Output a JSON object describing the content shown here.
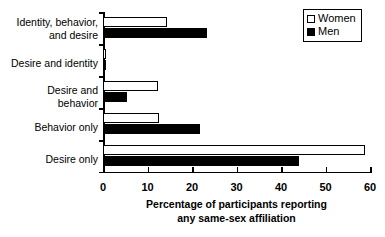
{
  "chart_data": {
    "type": "bar",
    "orientation": "horizontal",
    "title": "",
    "xlabel": "Percentage of participants reporting\nany same-sex affiliation",
    "ylabel": "",
    "xlim": [
      0,
      60
    ],
    "xticks": [
      0,
      10,
      20,
      30,
      40,
      50,
      60
    ],
    "grid": false,
    "legend_position": "top-right",
    "categories": [
      "Identity, behavior,\nand desire",
      "Desire and identity",
      "Desire and\nbehavior",
      "Behavior only",
      "Desire only"
    ],
    "series": [
      {
        "name": "Women",
        "color": "#ffffff",
        "values": [
          14.4,
          0.7,
          12.3,
          12.5,
          58.8
        ]
      },
      {
        "name": "Men",
        "color": "#000000",
        "values": [
          23.3,
          0.6,
          5.5,
          21.8,
          44.0
        ]
      }
    ]
  },
  "legend": {
    "items": [
      {
        "label": "Women"
      },
      {
        "label": "Men"
      }
    ]
  },
  "axis": {
    "tick_labels": [
      "0",
      "10",
      "20",
      "30",
      "40",
      "50",
      "60"
    ],
    "title_line1": "Percentage of participants reporting",
    "title_line2": "any same-sex affiliation"
  }
}
